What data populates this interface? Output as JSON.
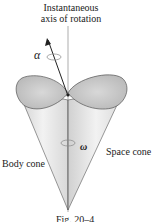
{
  "figure": {
    "axis_label_line1": "Instantaneous",
    "axis_label_line2": "axis of rotation",
    "alpha_symbol": "α",
    "omega_symbol": "ω",
    "space_cone_label": "Space cone",
    "body_cone_label": "Body cone",
    "caption": "Fig. 20–4"
  },
  "colors": {
    "cone_fill": "#e4e4e4",
    "cone_top": "#c8c8c8",
    "line": "#333333"
  }
}
